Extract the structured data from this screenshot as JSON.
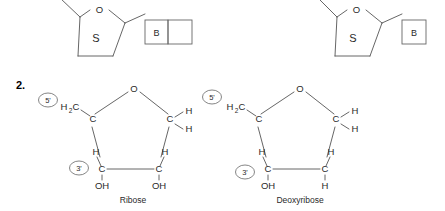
{
  "page": {
    "width": 445,
    "height": 211,
    "background": "#ffffff",
    "ink": "#2a2a2a",
    "line_color": "#555555"
  },
  "question": {
    "number_label": "2."
  },
  "top_row": {
    "description": "Two nucleotide schematic diagrams, cropped at top edge",
    "nucleotides": [
      {
        "id": "nucleotide-left",
        "sugar_label": "S",
        "ring_oxygen_label": "O",
        "base_box": {
          "base_label": "B",
          "compartments": 2,
          "second_compartment_label": ""
        }
      },
      {
        "id": "nucleotide-right",
        "sugar_label": "S",
        "ring_oxygen_label": "O",
        "base_box": {
          "base_label": "B",
          "compartments": 1,
          "second_compartment_label": ""
        }
      }
    ]
  },
  "sugars": [
    {
      "id": "ribose",
      "caption": "Ribose",
      "ring_oxygen_label": "O",
      "marker_5prime": "5'",
      "marker_3prime": "3'",
      "ch2_label": "H",
      "ch2_sub": "2",
      "ch2_carbon": "C",
      "carbons": {
        "c4": "C",
        "c1": "C",
        "c3": "C",
        "c2": "C"
      },
      "c1_hydrogens": [
        "H",
        "H"
      ],
      "c3_hydrogen": "H",
      "c2_hydrogen": "H",
      "c3_substituent": "OH",
      "c2_substituent": "OH"
    },
    {
      "id": "deoxyribose",
      "caption": "Deoxyribose",
      "ring_oxygen_label": "O",
      "marker_5prime": "5'",
      "marker_3prime": "3'",
      "ch2_label": "H",
      "ch2_sub": "2",
      "ch2_carbon": "C",
      "carbons": {
        "c4": "C",
        "c1": "C",
        "c3": "C",
        "c2": "C"
      },
      "c1_hydrogens": [
        "H",
        "H"
      ],
      "c3_hydrogen": "H",
      "c2_hydrogen": "H",
      "c3_substituent": "OH",
      "c2_substituent": "H"
    }
  ]
}
